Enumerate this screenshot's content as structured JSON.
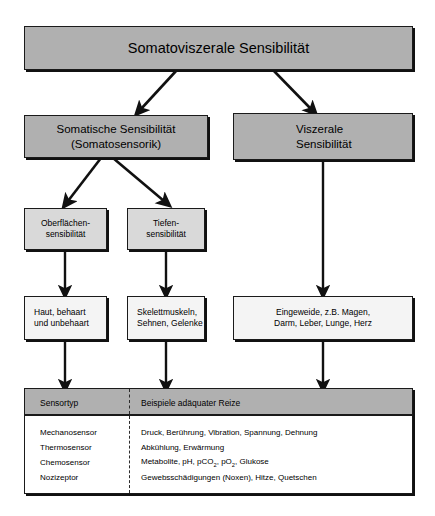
{
  "nodes": {
    "root": "Somatoviszerale Sensibilität",
    "somatic": "Somatische Sensibilität\n(Somatosensorik)",
    "visceral": "Viszerale\nSensibilität",
    "surface": "Oberflächen-\nsensibilität",
    "deep": "Tiefen-\nsensibilität",
    "skin": "Haut, behaart\nund unbehaart",
    "muscle": "Skelettmuskeln,\nSehnen, Gelenke",
    "organs": "Eingeweide, z.B. Magen,\nDarm, Leber, Lunge, Herz"
  },
  "table": {
    "headers": [
      "Sensortyp",
      "Beispiele adäquater Reize"
    ],
    "rows": [
      {
        "type": "Mechanosensor",
        "examples": "Druck, Berührung, Vibration, Spannung, Dehnung"
      },
      {
        "type": "Thermosensor",
        "examples": "Abkühlung, Erwärmung"
      },
      {
        "type": "Chemosensor",
        "examples_html": "Metabolite, pH, pCO<sub>2</sub>, pO<sub>2</sub>, Glukose"
      },
      {
        "type": "Nozizeptor",
        "examples": "Gewebsschädigungen (Noxen), Hitze, Quetschen"
      }
    ]
  },
  "colors": {
    "level1_fill": "#b0b0b0",
    "level2_fill": "#b0b0b0",
    "level3_fill": "#d9d9d9",
    "level4_fill": "#f4f4f4",
    "table_header_fill": "#b0b0b0",
    "stroke": "#1a1a1a",
    "background": "#ffffff"
  }
}
